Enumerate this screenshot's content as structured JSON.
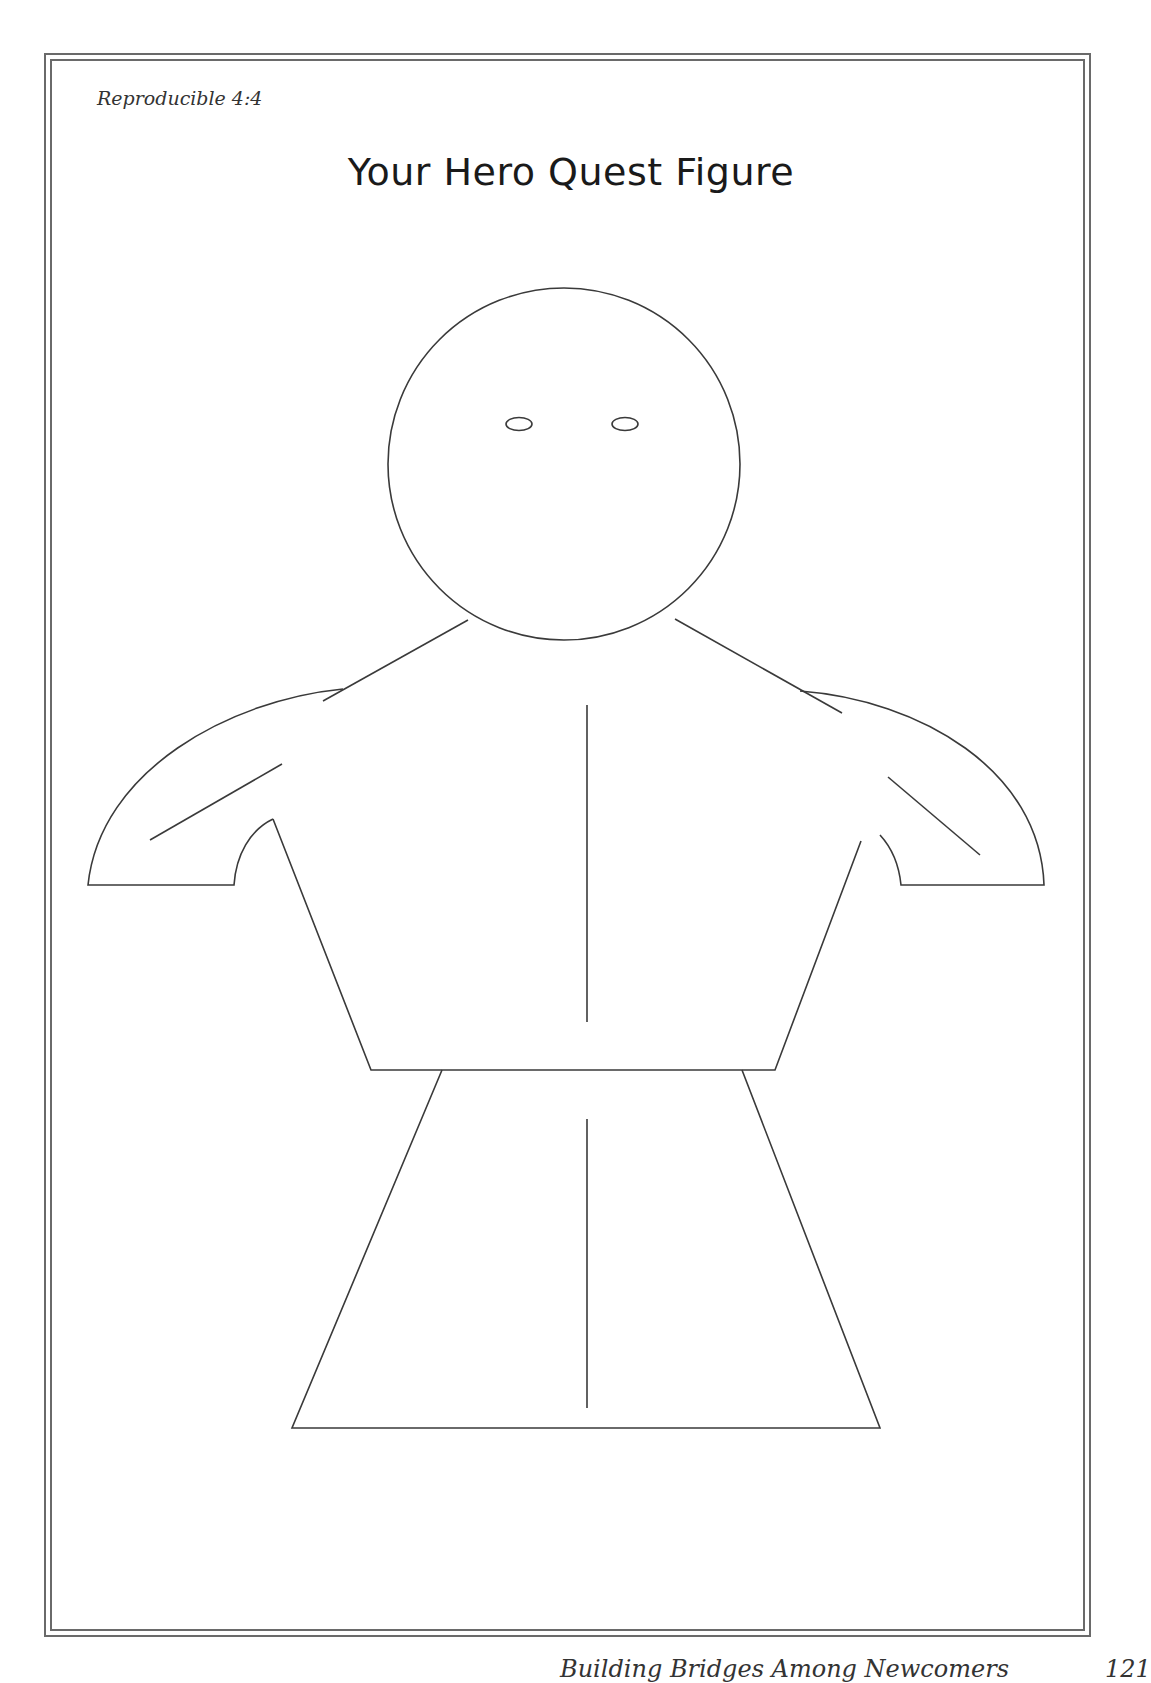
{
  "header": {
    "label": "Reproducible 4:4"
  },
  "title": "Your Hero Quest Figure",
  "figure": {
    "parts": [
      "head",
      "left-eye",
      "right-eye",
      "neck-lines",
      "left-arm",
      "right-arm",
      "torso",
      "skirt",
      "center-lines"
    ]
  },
  "footer": {
    "text": "Building Bridges Among Newcomers",
    "page_number": "121"
  },
  "colors": {
    "line": "#3a3a3a",
    "frame": "#6a6a6a",
    "background": "#ffffff"
  }
}
